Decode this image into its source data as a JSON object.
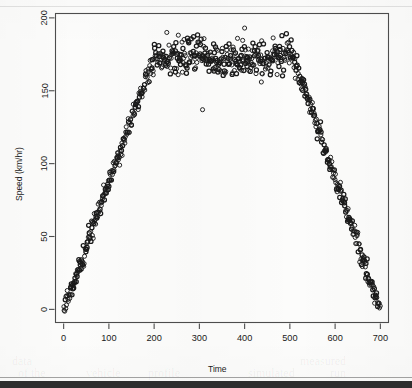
{
  "figure": {
    "background_color": "#fcfcfb",
    "frame_color": "#4d4d4d",
    "point_color": "#1a1a1a",
    "is_scanned_page": true
  },
  "chart_data": {
    "type": "scatter",
    "title": "",
    "subtitle": "",
    "xlabel": "Time",
    "ylabel": "Speed (km/hr)",
    "xlim": [
      -18,
      718
    ],
    "ylim": [
      -9,
      203
    ],
    "xticks": [
      0,
      100,
      200,
      300,
      400,
      500,
      600,
      700
    ],
    "xticklabels": [
      "0",
      "100",
      "200",
      "300",
      "400",
      "500",
      "600",
      "700"
    ],
    "yticks": [
      0,
      50,
      100,
      150,
      200
    ],
    "yticklabels": [
      "0",
      "50",
      "100",
      "150",
      "200"
    ],
    "grid": false,
    "legend": null,
    "marker": "open-circle",
    "marker_size": 4.1,
    "n_points": 700,
    "profile": {
      "accel_start_x": 0,
      "accel_end_x": 200,
      "accel_start_y": 0,
      "accel_end_y": 174,
      "cruise_start_x": 200,
      "cruise_end_x": 505,
      "cruise_mean_y": 173,
      "cruise_noise_sd": 5.5,
      "decel_start_x": 505,
      "decel_end_x": 700,
      "decel_start_y": 172,
      "decel_end_y": 0,
      "ramp_noise_sd": 3.4
    },
    "annotations": [
      {
        "label": "low-outlier",
        "x": 307,
        "y": 137
      },
      {
        "label": "high-outlier",
        "x": 400,
        "y": 193
      },
      {
        "label": "low-outlier",
        "x": 437,
        "y": 156
      },
      {
        "label": "low-outlier",
        "x": 253,
        "y": 161
      },
      {
        "label": "high-outlier",
        "x": 228,
        "y": 190
      }
    ]
  },
  "ghost_text": [
    {
      "text": "of the",
      "x": 18,
      "y": 366
    },
    {
      "text": "vehicle",
      "x": 86,
      "y": 366
    },
    {
      "text": "profile",
      "x": 148,
      "y": 366
    },
    {
      "text": "simulated",
      "x": 248,
      "y": 366
    },
    {
      "text": "run",
      "x": 330,
      "y": 366
    },
    {
      "text": "data",
      "x": 12,
      "y": 354
    },
    {
      "text": "measured",
      "x": 300,
      "y": 354
    }
  ]
}
